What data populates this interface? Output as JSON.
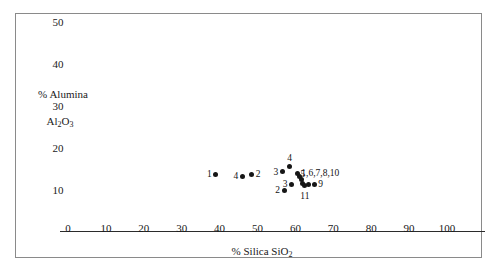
{
  "chart_data": {
    "type": "scatter",
    "title": "",
    "xlabel": "% Silica SiO2",
    "xlabel_html": "% Silica SiO<sub>2</sub>",
    "ylabel_line1": "% Alumina",
    "ylabel_line2": "Al2O3",
    "ylabel_line2_html": "Al<sub>2</sub>O<sub>3</sub>",
    "xlim": [
      0,
      110
    ],
    "ylim": [
      0,
      55
    ],
    "xticks": [
      0,
      10,
      20,
      30,
      40,
      50,
      60,
      70,
      80,
      90,
      100
    ],
    "xticklabels": [
      "0",
      "10",
      "20",
      "30",
      "40",
      "50",
      "60",
      "70",
      "80",
      "90",
      "100"
    ],
    "yticks": [
      10,
      20,
      30,
      40,
      50
    ],
    "yticklabels": [
      "10",
      "20",
      "30",
      "40",
      "50"
    ],
    "grid": false,
    "legend": "none",
    "marker_color": "#161616",
    "frame_color": "#8a8a8a",
    "points": [
      {
        "label": "1",
        "x": 39.0,
        "y": 13.8,
        "label_pos": "left"
      },
      {
        "label": "4",
        "x": 46.0,
        "y": 13.3,
        "label_pos": "left"
      },
      {
        "label": "2",
        "x": 48.5,
        "y": 13.8,
        "label_pos": "right"
      },
      {
        "label": "3",
        "x": 56.5,
        "y": 14.3,
        "label_pos": "left"
      },
      {
        "label": "4",
        "x": 58.5,
        "y": 15.5,
        "label_pos": "above"
      },
      {
        "label": "1,6,7,8,10",
        "x": 60.5,
        "y": 14.0,
        "label_pos": "right"
      },
      {
        "label": "",
        "x": 61.0,
        "y": 13.2,
        "label_pos": "none"
      },
      {
        "label": "",
        "x": 61.5,
        "y": 12.6,
        "label_pos": "none"
      },
      {
        "label": "3",
        "x": 59.0,
        "y": 11.4,
        "label_pos": "left"
      },
      {
        "label": "5",
        "x": 62.0,
        "y": 11.6,
        "label_pos": "above"
      },
      {
        "label": "11",
        "x": 62.5,
        "y": 11.0,
        "label_pos": "below"
      },
      {
        "label": "",
        "x": 63.5,
        "y": 11.4,
        "label_pos": "none"
      },
      {
        "label": "9",
        "x": 65.0,
        "y": 11.4,
        "label_pos": "right"
      },
      {
        "label": "2",
        "x": 57.0,
        "y": 10.0,
        "label_pos": "left"
      }
    ]
  },
  "axes_geometry": {
    "x0_px": 68,
    "px_per_x_unit": 3.79,
    "y0_px": 232,
    "px_per_y_unit": 4.2
  }
}
